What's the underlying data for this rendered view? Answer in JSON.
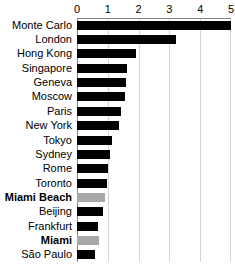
{
  "chart_data": {
    "type": "bar",
    "orientation": "horizontal",
    "title": "",
    "xlabel": "",
    "ylabel": "",
    "xlim": [
      0,
      5
    ],
    "xticks": [
      0,
      1,
      2,
      3,
      4,
      5
    ],
    "xtick_labels": [
      "0",
      "1",
      "2",
      "3",
      "4",
      "5"
    ],
    "grid": true,
    "grid_axis": "x",
    "legend": false,
    "categories": [
      "Monte Carlo",
      "London",
      "Hong Kong",
      "Singapore",
      "Geneva",
      "Moscow",
      "Paris",
      "New York",
      "Tokyo",
      "Sydney",
      "Rome",
      "Toronto",
      "Miami Beach",
      "Beijing",
      "Frankfurt",
      "Miami",
      "São Paulo"
    ],
    "values": [
      5.0,
      3.2,
      1.9,
      1.62,
      1.58,
      1.55,
      1.42,
      1.35,
      1.14,
      1.07,
      1.0,
      0.97,
      0.92,
      0.85,
      0.68,
      0.7,
      0.6
    ],
    "highlighted": [
      "Miami Beach",
      "Miami"
    ],
    "colors": {
      "bar": "#000000",
      "bar_highlight": "#a8a8a8",
      "gridline": "#d4d4d4",
      "axis": "#8a8a8a",
      "text": "#000000",
      "background": "#ffffff"
    }
  }
}
